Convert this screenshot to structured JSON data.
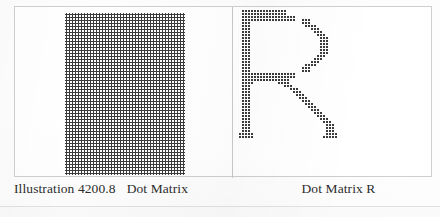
{
  "figure": {
    "panels": [
      {
        "name": "solid-dot-matrix",
        "caption_number": "Illustration 4200.8",
        "caption_label": "Dot Matrix",
        "pattern": "solid-rectangle",
        "dot_color": "#3b3b3b",
        "dot_pitch_px": 3,
        "dot_size_px": 2,
        "grid_cols": 40,
        "grid_rows": 54
      },
      {
        "name": "letter-r-dot-matrix",
        "caption_label": "Dot Matrix R",
        "pattern": "letter-R",
        "dot_color": "#3b3b3b",
        "dot_pitch_px": 3,
        "dot_size_px": 2,
        "grid_cols": 44,
        "grid_rows": 54
      }
    ],
    "border_color": "#cfcfcf",
    "divider_color": "#c9c9c9",
    "background_color": "#ffffff"
  },
  "captions": {
    "left_number": "Illustration 4200.8",
    "left_label": "Dot Matrix",
    "right_label": "Dot Matrix R"
  },
  "letter_r_matrix": {
    "description": "Per-row dot runs for the letter R, each entry is [start_col, end_col] inclusive on a 44-column grid.",
    "rows": [
      [
        [
          2,
          16
        ]
      ],
      [
        [
          2,
          16
        ]
      ],
      [
        [
          2,
          19
        ]
      ],
      [
        [
          2,
          19
        ],
        [
          22,
          24
        ]
      ],
      [
        [
          2,
          4
        ],
        [
          22,
          24
        ]
      ],
      [
        [
          2,
          4
        ],
        [
          23,
          26
        ]
      ],
      [
        [
          2,
          4
        ],
        [
          25,
          27
        ]
      ],
      [
        [
          2,
          4
        ],
        [
          26,
          28
        ]
      ],
      [
        [
          2,
          4
        ],
        [
          27,
          29
        ]
      ],
      [
        [
          2,
          4
        ],
        [
          28,
          30
        ]
      ],
      [
        [
          2,
          4
        ],
        [
          28,
          30
        ]
      ],
      [
        [
          2,
          4
        ],
        [
          28,
          30
        ]
      ],
      [
        [
          2,
          4
        ],
        [
          28,
          30
        ]
      ],
      [
        [
          2,
          4
        ],
        [
          28,
          30
        ]
      ],
      [
        [
          2,
          4
        ],
        [
          28,
          30
        ]
      ],
      [
        [
          2,
          4
        ],
        [
          27,
          29
        ]
      ],
      [
        [
          2,
          4
        ],
        [
          26,
          28
        ]
      ],
      [
        [
          2,
          4
        ],
        [
          25,
          27
        ]
      ],
      [
        [
          2,
          4
        ],
        [
          23,
          26
        ]
      ],
      [
        [
          2,
          4
        ],
        [
          22,
          24
        ]
      ],
      [
        [
          2,
          4
        ],
        [
          22,
          24
        ]
      ],
      [
        [
          2,
          19
        ]
      ],
      [
        [
          2,
          19
        ]
      ],
      [
        [
          2,
          17
        ]
      ],
      [
        [
          2,
          5
        ],
        [
          14,
          17
        ]
      ],
      [
        [
          2,
          4
        ],
        [
          16,
          18
        ]
      ],
      [
        [
          2,
          4
        ],
        [
          18,
          20
        ]
      ],
      [
        [
          2,
          4
        ],
        [
          19,
          21
        ]
      ],
      [
        [
          2,
          4
        ],
        [
          20,
          22
        ]
      ],
      [
        [
          2,
          4
        ],
        [
          21,
          23
        ]
      ],
      [
        [
          2,
          4
        ],
        [
          22,
          24
        ]
      ],
      [
        [
          2,
          4
        ],
        [
          23,
          25
        ]
      ],
      [
        [
          2,
          4
        ],
        [
          24,
          26
        ]
      ],
      [
        [
          2,
          4
        ],
        [
          25,
          27
        ]
      ],
      [
        [
          2,
          4
        ],
        [
          26,
          28
        ]
      ],
      [
        [
          2,
          4
        ],
        [
          27,
          29
        ]
      ],
      [
        [
          2,
          4
        ],
        [
          28,
          30
        ]
      ],
      [
        [
          2,
          4
        ],
        [
          29,
          31
        ]
      ],
      [
        [
          2,
          4
        ],
        [
          30,
          32
        ]
      ],
      [
        [
          2,
          4
        ],
        [
          30,
          32
        ]
      ],
      [
        [
          2,
          4
        ],
        [
          30,
          32
        ]
      ],
      [
        [
          1,
          5
        ],
        [
          30,
          33
        ]
      ],
      [
        [
          1,
          5
        ],
        [
          29,
          33
        ]
      ]
    ]
  }
}
